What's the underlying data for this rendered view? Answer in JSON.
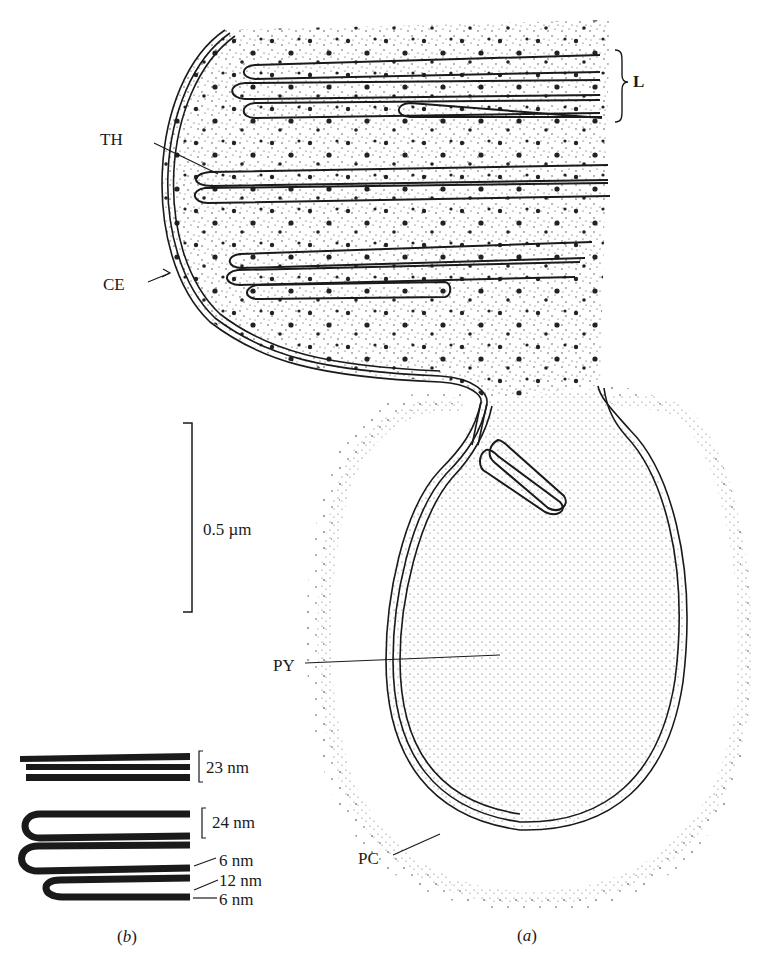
{
  "figure": {
    "part_a": {
      "caption_open": "(",
      "caption_letter": "a",
      "caption_close": ")",
      "labels": {
        "L": "L",
        "TH": "TH",
        "CE": "CE",
        "PY": "PY",
        "PC": "PC"
      },
      "scale_bar": "0.5 µm"
    },
    "part_b": {
      "caption_open": "(",
      "caption_letter": "b",
      "caption_close": ")",
      "measurements": {
        "stack_spacing": "23 nm",
        "pair_spacing": "24 nm",
        "membrane_1": "6 nm",
        "lumen": "12 nm",
        "membrane_2": "6 nm"
      }
    },
    "colors": {
      "ink": "#1a1a1a",
      "background": "#ffffff"
    }
  }
}
